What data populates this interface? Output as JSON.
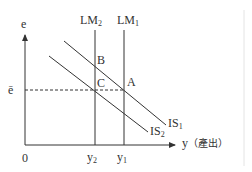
{
  "diagram": {
    "type": "IS-LM diagram",
    "axes": {
      "y_axis_label": "e",
      "x_axis_label": "y",
      "x_axis_note": "（產出）",
      "origin": "0"
    },
    "curves": {
      "lm1": {
        "base": "LM",
        "sub": "1"
      },
      "lm2": {
        "base": "LM",
        "sub": "2"
      },
      "is1": {
        "base": "IS",
        "sub": "1"
      },
      "is2": {
        "base": "IS",
        "sub": "2"
      }
    },
    "points": {
      "a": "A",
      "b": "B",
      "c": "C"
    },
    "ticks": {
      "e_bar": "ē",
      "y1": {
        "base": "y",
        "sub": "1"
      },
      "y2": {
        "base": "y",
        "sub": "2"
      }
    },
    "colors": {
      "line": "#333333",
      "divider": "#e0e0e0"
    }
  }
}
